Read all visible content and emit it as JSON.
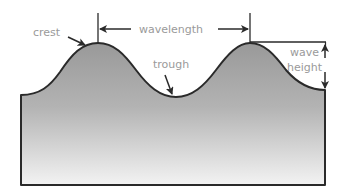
{
  "diagram": {
    "type": "wave-anatomy",
    "labels": {
      "crest": "crest",
      "wavelength": "wavelength",
      "trough": "trough",
      "wave_height_line1": "wave",
      "wave_height_line2": "height"
    },
    "colors": {
      "label_text": "#9a9a9a",
      "outline": "#2a2a2a",
      "fill_top": "#9c9c9c",
      "fill_bottom": "#f2f2f2",
      "background": "#ffffff"
    }
  }
}
